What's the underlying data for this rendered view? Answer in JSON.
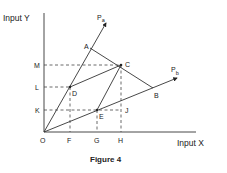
{
  "diagram": {
    "y_axis_label": "Input  Y",
    "x_axis_label": "Input  X",
    "caption": "Figure  4",
    "rays": [
      {
        "name": "Pa",
        "label_main": "P",
        "label_sub": "a"
      },
      {
        "name": "Pb",
        "label_main": "P",
        "label_sub": "b"
      }
    ],
    "points": {
      "O": "O",
      "A": "A",
      "B": "B",
      "C": "C",
      "D": "D",
      "E": "E",
      "J": "J"
    },
    "y_ticks": {
      "M": "M",
      "L": "L",
      "K": "K"
    },
    "x_ticks": {
      "F": "F",
      "G": "G",
      "H": "H"
    }
  }
}
